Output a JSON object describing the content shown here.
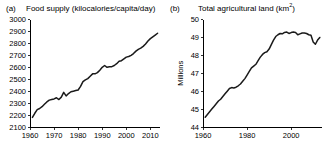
{
  "figure": {
    "panels": [
      {
        "label": "(a)",
        "title_main": "Food supply (kilocalories/capita/day)",
        "title_pre": "Food supply (kilocalories/capita/day)",
        "title_sup": "",
        "title_post": ""
      },
      {
        "label": "(b)",
        "title_pre": "Total agricultural land (km",
        "title_sup": "2",
        "title_post": ")"
      }
    ]
  },
  "chart_data": [
    {
      "type": "line",
      "panel": "(a)",
      "title": "Food supply (kilocalories/capita/day)",
      "xlabel": "",
      "ylabel": "",
      "xlim": [
        1960,
        2014
      ],
      "ylim": [
        2100,
        3000
      ],
      "xticks": [
        1960,
        1970,
        1980,
        1990,
        2000,
        2010
      ],
      "yticks": [
        2100,
        2200,
        2300,
        2400,
        2500,
        2600,
        2700,
        2800,
        2900,
        3000
      ],
      "grid": false,
      "legend": "none",
      "line_color": "#1a1a1a",
      "series": [
        {
          "name": "Food supply",
          "x": [
            1961,
            1962,
            1963,
            1964,
            1965,
            1966,
            1967,
            1968,
            1969,
            1970,
            1971,
            1972,
            1973,
            1974,
            1975,
            1976,
            1977,
            1978,
            1979,
            1980,
            1981,
            1982,
            1983,
            1984,
            1985,
            1986,
            1987,
            1988,
            1989,
            1990,
            1991,
            1992,
            1993,
            1994,
            1995,
            1996,
            1997,
            1998,
            1999,
            2000,
            2001,
            2002,
            2003,
            2004,
            2005,
            2006,
            2007,
            2008,
            2009,
            2010,
            2011,
            2012,
            2013
          ],
          "values": [
            2180,
            2215,
            2245,
            2255,
            2270,
            2290,
            2310,
            2325,
            2330,
            2335,
            2345,
            2330,
            2350,
            2390,
            2360,
            2380,
            2395,
            2400,
            2405,
            2410,
            2440,
            2480,
            2495,
            2505,
            2525,
            2545,
            2545,
            2555,
            2575,
            2600,
            2615,
            2600,
            2605,
            2605,
            2615,
            2630,
            2650,
            2655,
            2670,
            2685,
            2690,
            2700,
            2715,
            2735,
            2750,
            2760,
            2775,
            2795,
            2820,
            2840,
            2855,
            2870,
            2885
          ]
        }
      ]
    },
    {
      "type": "line",
      "panel": "(b)",
      "title": "Total agricultural land (km2)",
      "xlabel": "",
      "ylabel": "Millions",
      "xlim": [
        1960,
        2014
      ],
      "ylim": [
        44,
        50
      ],
      "xticks": [
        1960,
        1980,
        2000
      ],
      "yticks": [
        44,
        45,
        46,
        47,
        48,
        49,
        50
      ],
      "grid": false,
      "legend": "none",
      "line_color": "#1a1a1a",
      "series": [
        {
          "name": "Total agricultural land",
          "x": [
            1961,
            1962,
            1963,
            1964,
            1965,
            1966,
            1967,
            1968,
            1969,
            1970,
            1971,
            1972,
            1973,
            1974,
            1975,
            1976,
            1977,
            1978,
            1979,
            1980,
            1981,
            1982,
            1983,
            1984,
            1985,
            1986,
            1987,
            1988,
            1989,
            1990,
            1991,
            1992,
            1993,
            1994,
            1995,
            1996,
            1997,
            1998,
            1999,
            2000,
            2001,
            2002,
            2003,
            2004,
            2005,
            2006,
            2007,
            2008,
            2009,
            2010,
            2011,
            2012,
            2013
          ],
          "values": [
            44.55,
            44.7,
            44.85,
            45.0,
            45.15,
            45.3,
            45.45,
            45.55,
            45.7,
            45.85,
            46.0,
            46.15,
            46.2,
            46.18,
            46.22,
            46.3,
            46.4,
            46.55,
            46.7,
            46.9,
            47.1,
            47.3,
            47.4,
            47.5,
            47.7,
            47.9,
            48.05,
            48.15,
            48.2,
            48.35,
            48.6,
            48.85,
            49.05,
            49.15,
            49.22,
            49.2,
            49.28,
            49.3,
            49.22,
            49.27,
            49.3,
            49.28,
            49.15,
            49.2,
            49.25,
            49.25,
            49.22,
            49.15,
            49.12,
            48.75,
            48.62,
            48.85,
            49.0
          ]
        }
      ]
    }
  ]
}
